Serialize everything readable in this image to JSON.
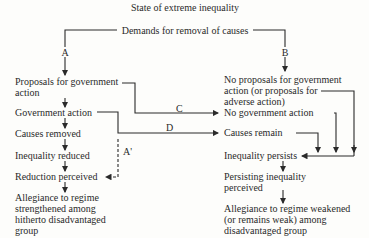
{
  "title": "State of extreme inequality",
  "top": "Demands for removal of causes",
  "labels": {
    "a": "A",
    "b": "B",
    "c": "C",
    "d": "D",
    "a_prime": "A'"
  },
  "left": {
    "proposals": [
      "Proposals for government",
      "action"
    ],
    "gov_action": "Government action",
    "causes_removed": "Causes removed",
    "inequality_reduced": "Inequality reduced",
    "reduction_perceived": "Reduction perceived",
    "allegiance": [
      "Allegiance to regime",
      "strengthened among",
      "hitherto disadvantaged",
      "group"
    ]
  },
  "right": {
    "no_proposals": [
      "No proposals for government",
      "action (or proposals for",
      "adverse action)"
    ],
    "no_gov_action": "No government action",
    "causes_remain": "Causes remain",
    "inequality_persists": "Inequality persists",
    "persisting": [
      "Persisting inequality",
      "perceived"
    ],
    "allegiance": [
      "Allegiance to regime weakened",
      "(or remains weak) among",
      "disadvantaged group"
    ]
  }
}
